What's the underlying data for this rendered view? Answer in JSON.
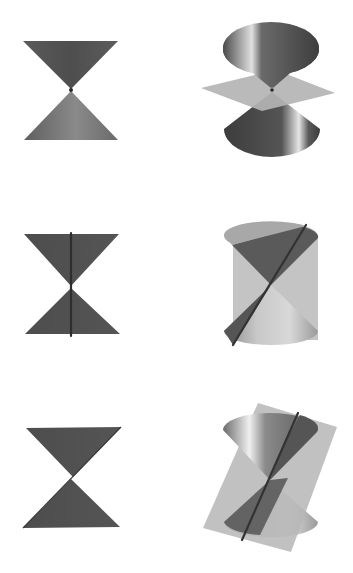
{
  "figure": {
    "layout": "3 rows x 2 columns; left column shows side view, right column shows 3D view with plane",
    "panels": [
      {
        "row": 1,
        "col": 1,
        "name": "double-cone-side-view-point",
        "intersection": "point (vertex)"
      },
      {
        "row": 1,
        "col": 2,
        "name": "double-cone-horizontal-plane",
        "intersection": "point (vertex)",
        "plane": "horizontal"
      },
      {
        "row": 2,
        "col": 1,
        "name": "double-cone-side-view-line",
        "intersection": "single line"
      },
      {
        "row": 2,
        "col": 2,
        "name": "double-cone-tangent-plane",
        "intersection": "single line",
        "plane": "vertical tangent"
      },
      {
        "row": 3,
        "col": 1,
        "name": "double-cone-side-view-crossing",
        "intersection": "pair of lines"
      },
      {
        "row": 3,
        "col": 2,
        "name": "double-cone-slanted-plane",
        "intersection": "pair of lines",
        "plane": "slanted through vertex"
      }
    ]
  },
  "colors": {
    "background": "#ffffff",
    "cone_dark": "#4a4a4a",
    "cone_mid": "#7a7a7a",
    "cone_light": "#d8d8d8",
    "plane": "#b8b8b8",
    "line": "#333333"
  }
}
